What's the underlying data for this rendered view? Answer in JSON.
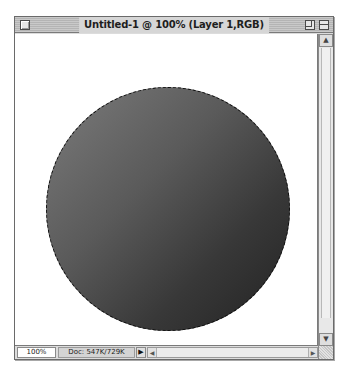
{
  "window": {
    "title": "Untitled-1 @ 100% (Layer 1,RGB)",
    "controls": {
      "close": "close-box",
      "zoom": "zoom-box",
      "collapse": "collapse-box"
    }
  },
  "canvas": {
    "background": "#ffffff",
    "shape": {
      "type": "circle",
      "fill_gradient": [
        "#7c7c7c",
        "#5a5a5a",
        "#383838",
        "#222222"
      ],
      "selection": "marching-ants",
      "cx": 153,
      "cy": 175,
      "r": 122
    }
  },
  "statusbar": {
    "zoom_level": "100%",
    "doc_info": "Doc: 547K/729K",
    "menu_arrow": "▶"
  },
  "scrollbars": {
    "vertical": {
      "up_arrow": "▲",
      "down_arrow": "▼"
    },
    "horizontal": {
      "left_arrow": "◀",
      "right_arrow": "▶"
    }
  }
}
